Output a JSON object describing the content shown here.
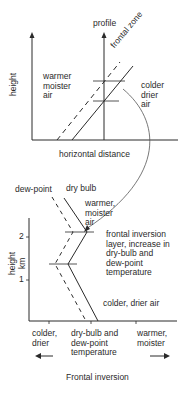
{
  "top_diagram": {
    "profile_label": "profile",
    "frontal_zone_label": "frontal zone",
    "y_axis_label": "height",
    "x_axis_label": "horizontal distance",
    "warm_side_label": "warmer\nmoister\nair",
    "cold_side_label": "colder\ndrier\nair"
  },
  "bottom_diagram": {
    "dew_point_label": "dew-point",
    "dry_bulb_label": "dry bulb",
    "upper_air_label": "warmer,\nmoister\nair",
    "inversion_annotation": "frontal inversion\nlayer, increase in\ndry-bulb and\ndew-point\ntemperature",
    "lower_air_label": "colder, drier air",
    "y_axis_label": "height\nkm",
    "y_ticks": [
      "2",
      "1"
    ],
    "x_left_label": "colder,\ndrier",
    "x_center_label": "dry-bulb and\ndew-point\ntemperature",
    "x_right_label": "warmer,\nmoister",
    "left_arrow_icon": "arrow-left",
    "right_arrow_icon": "arrow-right"
  },
  "caption": "Frontal inversion",
  "colors": {
    "line": "#2a2a2a",
    "connector": "#555555",
    "background": "#ffffff"
  }
}
